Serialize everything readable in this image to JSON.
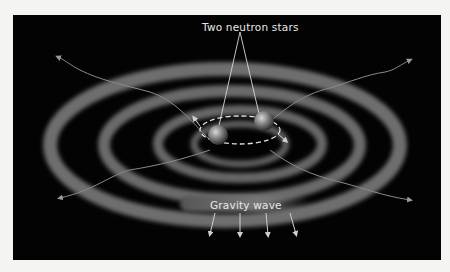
{
  "figure": {
    "background_color": "#030303",
    "labels": {
      "stars": "Two neutron stars",
      "wave": "Gravity wave"
    },
    "elements": {
      "ring_count": 4,
      "star_count": 2,
      "outgoing_arrows": 6,
      "downward_arrows": 4,
      "orbit_style": "dashed ellipse"
    }
  }
}
